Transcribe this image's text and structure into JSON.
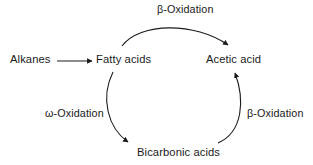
{
  "diagram": {
    "type": "cycle-flow",
    "background_color": "#ffffff",
    "stroke_color": "#1a1a1a",
    "nodes": [
      {
        "id": "alkanes",
        "label": "Alkanes"
      },
      {
        "id": "fatty",
        "label": "Fatty acids"
      },
      {
        "id": "acetic",
        "label": "Acetic acid"
      },
      {
        "id": "bicarbonic",
        "label": "Bicarbonic acids"
      }
    ],
    "edges": [
      {
        "id": "alkanes-to-fatty",
        "from": "alkanes",
        "to": "fatty",
        "label": "",
        "shape": "straight"
      },
      {
        "id": "fatty-to-acetic",
        "from": "fatty",
        "to": "acetic",
        "label": "β-Oxidation",
        "shape": "arc-top"
      },
      {
        "id": "fatty-to-bicarbonic",
        "from": "fatty",
        "to": "bicarbonic",
        "label": "ω-Oxidation",
        "shape": "arc-left"
      },
      {
        "id": "bicarbonic-to-acetic",
        "from": "bicarbonic",
        "to": "acetic",
        "label": "β-Oxidation",
        "shape": "arc-right"
      }
    ]
  }
}
